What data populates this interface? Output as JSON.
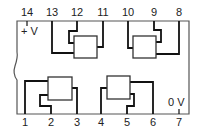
{
  "diagram": {
    "type": "ic-pinout-quad-2-input-gate",
    "pins_top": [
      {
        "num": "14",
        "x": 27
      },
      {
        "num": "13",
        "x": 52
      },
      {
        "num": "12",
        "x": 77
      },
      {
        "num": "11",
        "x": 103
      },
      {
        "num": "10",
        "x": 128
      },
      {
        "num": "9",
        "x": 154
      },
      {
        "num": "8",
        "x": 179
      }
    ],
    "pins_bottom": [
      {
        "num": "1",
        "x": 25
      },
      {
        "num": "2",
        "x": 51
      },
      {
        "num": "3",
        "x": 77
      },
      {
        "num": "4",
        "x": 101
      },
      {
        "num": "5",
        "x": 127
      },
      {
        "num": "6",
        "x": 153
      },
      {
        "num": "7",
        "x": 179
      }
    ],
    "supply_label": "+ V",
    "ground_label": "0 V",
    "gates": [
      {
        "inputs": [
          "13",
          "12"
        ],
        "output": "11"
      },
      {
        "inputs": [
          "10",
          "9"
        ],
        "output": "8"
      },
      {
        "inputs": [
          "1",
          "2"
        ],
        "output": "3"
      },
      {
        "inputs": [
          "4",
          "5"
        ],
        "output": "6"
      }
    ],
    "colors": {
      "line": "#111111",
      "outline": "#555555",
      "background": "#ffffff"
    }
  }
}
